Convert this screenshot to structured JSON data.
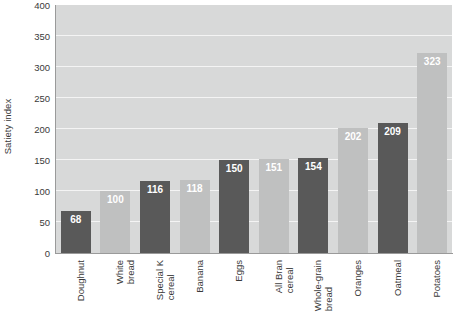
{
  "chart_data": {
    "type": "bar",
    "title": "",
    "xlabel": "",
    "ylabel": "Satiety index",
    "ylim": [
      0,
      400
    ],
    "ytick_step": 50,
    "grid": true,
    "legend": "none",
    "categories": [
      "Doughnut",
      "White bread",
      "Special K cereal",
      "Banana",
      "Eggs",
      "All Bran cereal",
      "Whole-grain bread",
      "Oranges",
      "Oatmeal",
      "Potatoes"
    ],
    "values": [
      68,
      100,
      116,
      118,
      150,
      151,
      154,
      202,
      209,
      323
    ],
    "yticks": [
      0,
      50,
      100,
      150,
      200,
      250,
      300,
      350,
      400
    ],
    "bar_colors": [
      "#595959",
      "#bfc0c0",
      "#595959",
      "#bfc0c0",
      "#595959",
      "#bfc0c0",
      "#595959",
      "#bfc0c0",
      "#595959",
      "#bfc0c0"
    ],
    "label_color": "#ffffff",
    "plot_background": "#d8d9d9",
    "gridline_color": "#f4f4f4",
    "category_lines": [
      [
        "Doughnut",
        ""
      ],
      [
        "White",
        "bread"
      ],
      [
        "Special K",
        "cereal"
      ],
      [
        "Banana",
        ""
      ],
      [
        "Eggs",
        ""
      ],
      [
        "All Bran",
        "cereal"
      ],
      [
        "Whole-grain",
        "bread"
      ],
      [
        "Oranges",
        ""
      ],
      [
        "Oatmeal",
        ""
      ],
      [
        "Potatoes",
        ""
      ]
    ]
  }
}
